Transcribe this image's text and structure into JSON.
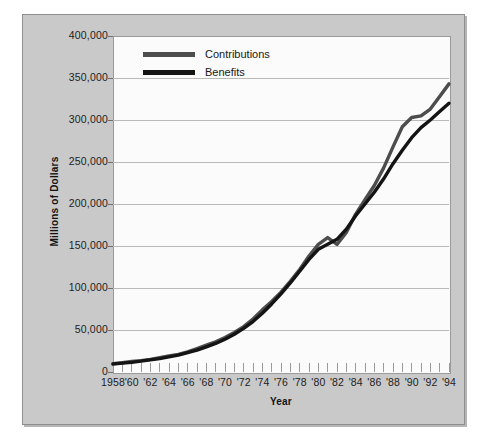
{
  "chart_data": {
    "type": "line",
    "title": "",
    "xlabel": "Year",
    "ylabel": "Millions of Dollars",
    "xlim": [
      1958,
      1994
    ],
    "ylim": [
      0,
      400000
    ],
    "grid": true,
    "legend_position": "top-left-inside",
    "y_ticks": [
      400000,
      350000,
      300000,
      250000,
      200000,
      150000,
      100000,
      50000,
      0
    ],
    "y_tick_labels": [
      "400,000",
      "350,000",
      "300,000",
      "250,000",
      "200,000",
      "150,000",
      "100,000",
      "50,000",
      "0"
    ],
    "x_ticks": [
      1958,
      1959,
      1960,
      1961,
      1962,
      1963,
      1964,
      1965,
      1966,
      1967,
      1968,
      1969,
      1970,
      1971,
      1972,
      1973,
      1974,
      1975,
      1976,
      1977,
      1978,
      1979,
      1980,
      1981,
      1982,
      1983,
      1984,
      1985,
      1986,
      1987,
      1988,
      1989,
      1990,
      1991,
      1992,
      1993,
      1994
    ],
    "x_tick_labels": [
      "1958",
      "'60",
      "'62",
      "'64",
      "'66",
      "'68",
      "'70",
      "'72",
      "'74",
      "'76",
      "'78",
      "'80",
      "'82",
      "'84",
      "'86",
      "'88",
      "'90",
      "'92",
      "'94"
    ],
    "x_labeled_years": [
      1958,
      1960,
      1962,
      1964,
      1966,
      1968,
      1970,
      1972,
      1974,
      1976,
      1978,
      1980,
      1982,
      1984,
      1986,
      1988,
      1990,
      1992,
      1994
    ],
    "x": [
      1958,
      1959,
      1960,
      1961,
      1962,
      1963,
      1964,
      1965,
      1966,
      1967,
      1968,
      1969,
      1970,
      1971,
      1972,
      1973,
      1974,
      1975,
      1976,
      1977,
      1978,
      1979,
      1980,
      1981,
      1982,
      1983,
      1984,
      1985,
      1986,
      1987,
      1988,
      1989,
      1990,
      1991,
      1992,
      1993,
      1994
    ],
    "series": [
      {
        "name": "Contributions",
        "color": "#4d4d4d",
        "values": [
          10000,
          11000,
          12500,
          13500,
          15000,
          17000,
          19000,
          21000,
          24000,
          28000,
          32000,
          36000,
          41000,
          47000,
          54000,
          63000,
          74000,
          84000,
          95000,
          108000,
          122000,
          138000,
          152000,
          160000,
          152000,
          166000,
          188000,
          205000,
          222000,
          243000,
          268000,
          292000,
          303000,
          305000,
          313000,
          328000,
          343000
        ]
      },
      {
        "name": "Benefits",
        "color": "#141414",
        "values": [
          9500,
          10500,
          11500,
          13000,
          14500,
          16000,
          18000,
          20000,
          23000,
          26000,
          30000,
          34000,
          39000,
          45000,
          52000,
          60000,
          70000,
          81000,
          93000,
          106000,
          120000,
          134000,
          146000,
          152000,
          158000,
          170000,
          186000,
          200000,
          214000,
          230000,
          248000,
          264000,
          279000,
          291000,
          300000,
          310000,
          320000
        ]
      }
    ]
  },
  "axes": {
    "y_title": "Millions of Dollars",
    "x_title": "Year"
  },
  "legend": {
    "items": [
      {
        "label": "Contributions",
        "color": "#4d4d4d"
      },
      {
        "label": "Benefits",
        "color": "#141414"
      }
    ]
  }
}
